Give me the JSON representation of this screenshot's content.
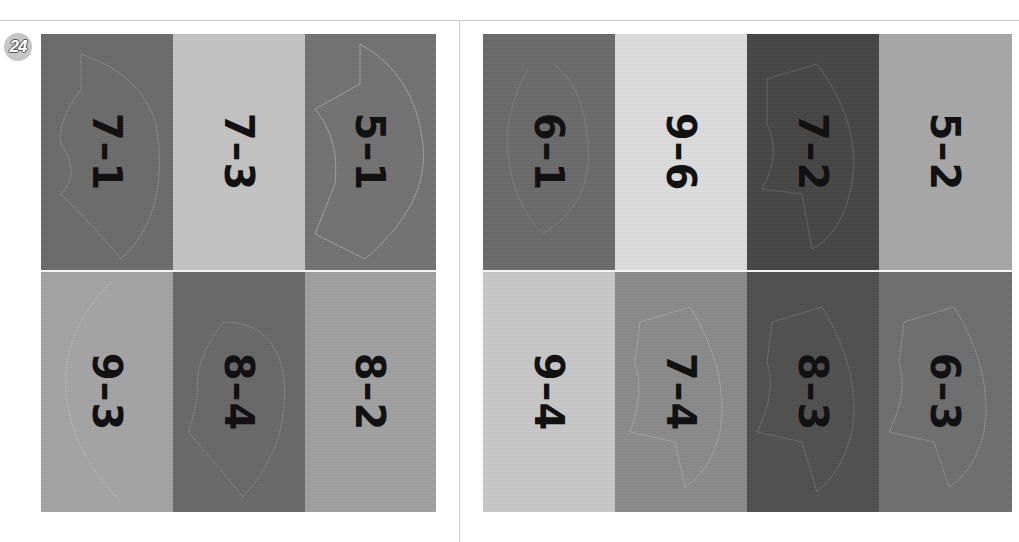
{
  "page": {
    "badge": "24",
    "left_panel": {
      "cards": [
        {
          "label": "7–1",
          "color": "#6b6b6b"
        },
        {
          "label": "7–3",
          "color": "#c4c4c4"
        },
        {
          "label": "5–1",
          "color": "#727272"
        },
        {
          "label": "9–3",
          "color": "#a4a4a4"
        },
        {
          "label": "8–4",
          "color": "#686868"
        },
        {
          "label": "8–2",
          "color": "#a0a0a0"
        }
      ]
    },
    "right_panel": {
      "cards": [
        {
          "label": "6–1",
          "color": "#6a6a6a"
        },
        {
          "label": "9–6",
          "color": "#dedede"
        },
        {
          "label": "7–2",
          "color": "#454545"
        },
        {
          "label": "5–2",
          "color": "#a8a8a8"
        },
        {
          "label": "9–4",
          "color": "#c8c8c8"
        },
        {
          "label": "7–4",
          "color": "#8a8a8a"
        },
        {
          "label": "8–3",
          "color": "#4f4f4f"
        },
        {
          "label": "6–3",
          "color": "#6e6e6e"
        }
      ]
    }
  }
}
